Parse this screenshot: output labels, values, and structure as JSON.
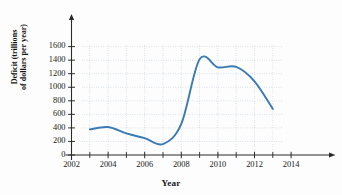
{
  "chart_data": {
    "type": "line",
    "title": "",
    "xlabel": "Year",
    "ylabel_lines": [
      "Deficit (trillions",
      "of dollars per year)"
    ],
    "ylabel": "Deficit (trillions of dollars per year)",
    "xlim": [
      2002,
      2014.6
    ],
    "ylim": [
      0,
      1720
    ],
    "grid": true,
    "legend_position": "none",
    "xticks_major": [
      2002,
      2004,
      2006,
      2008,
      2010,
      2012,
      2014
    ],
    "xticks_major_labels": [
      "2002",
      "2004",
      "2006",
      "2008",
      "2010",
      "2012",
      "2014"
    ],
    "xticks_minor": [
      2003,
      2005,
      2007,
      2009,
      2011,
      2013
    ],
    "yticks": [
      0,
      200,
      400,
      600,
      800,
      1000,
      1200,
      1400,
      1600
    ],
    "ytick_labels": [
      "0",
      "200",
      "400",
      "600",
      "800",
      "1000",
      "1200",
      "1400",
      "1600"
    ],
    "series": [
      {
        "name": "Deficit",
        "color": "#3a7ab5",
        "x": [
          2003,
          2004,
          2005,
          2006,
          2007,
          2008,
          2009,
          2010,
          2011,
          2012,
          2013
        ],
        "values": [
          378,
          413,
          318,
          248,
          161,
          459,
          1413,
          1294,
          1300,
          1087,
          680
        ]
      }
    ]
  },
  "axis": {
    "x_title": "Year",
    "y_title_line1": "Deficit (trillions",
    "y_title_line2": "of dollars per year)"
  },
  "style": {
    "line_color": "#3a7ab5",
    "grid_color": "#b9c6d4",
    "axis_color": "#2b2b2b",
    "text_color": "#1a1a1a",
    "background": "#fdfdfd"
  }
}
